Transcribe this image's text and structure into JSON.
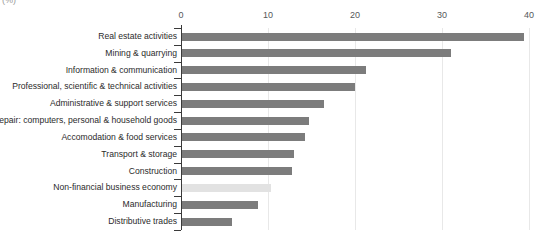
{
  "unit_label": "(%)",
  "colors": {
    "bar": "#7c7c7c",
    "bar_highlight": "#e2e2e2",
    "axis": "#3a3a3a",
    "grid": "#e8e8e8",
    "label_text": "#2b2b2b",
    "tick_text": "#55585a"
  },
  "chart_data": {
    "type": "bar",
    "orientation": "horizontal",
    "title": "",
    "subtitle": "",
    "xlabel": "(%)",
    "ylabel": "",
    "xlim": [
      0,
      40
    ],
    "xticks": [
      0,
      10,
      20,
      30,
      40
    ],
    "xticklabels": [
      "0",
      "10",
      "20",
      "30",
      "40"
    ],
    "grid": true,
    "legend": false,
    "legend_position": "none",
    "categories": [
      "Real estate activities",
      "Mining & quarrying",
      "Information & communication",
      "Professional, scientific & technical activities",
      "Administrative & support services",
      "Repair: computers, personal & household goods",
      "Accomodation & food services",
      "Transport & storage",
      "Construction",
      "Non-financial business economy",
      "Manufacturing",
      "Distributive trades"
    ],
    "values": [
      39.3,
      30.9,
      21.2,
      19.9,
      16.3,
      14.6,
      14.1,
      12.9,
      12.6,
      10.2,
      8.7,
      5.7
    ],
    "highlight_index": 9,
    "series": [
      {
        "name": "Share",
        "values": [
          39.3,
          30.9,
          21.2,
          19.9,
          16.3,
          14.6,
          14.1,
          12.9,
          12.6,
          10.2,
          8.7,
          5.7
        ]
      }
    ]
  }
}
